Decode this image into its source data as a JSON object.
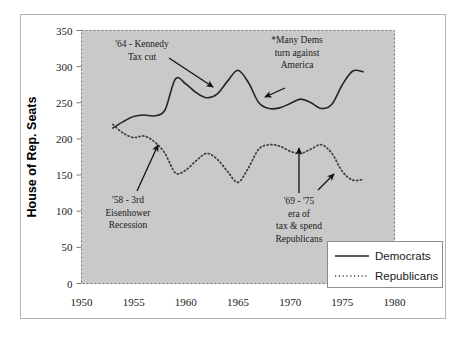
{
  "chart_data": {
    "type": "line",
    "title": "",
    "xlabel": "",
    "ylabel": "House of Rep. Seats",
    "xlim": [
      1950,
      1980
    ],
    "ylim": [
      0,
      350
    ],
    "xticks": [
      1950,
      1955,
      1960,
      1965,
      1970,
      1975,
      1980
    ],
    "yticks": [
      0,
      50,
      100,
      150,
      200,
      250,
      300,
      350
    ],
    "grid": false,
    "legend_position": "bottom-right",
    "plot_background": "#c9c9c9",
    "series": [
      {
        "name": "Democrats",
        "style": "solid",
        "color": "#262626",
        "x": [
          1953,
          1954,
          1955,
          1956,
          1957,
          1958,
          1959,
          1960,
          1961,
          1962,
          1963,
          1964,
          1965,
          1966,
          1967,
          1968,
          1969,
          1970,
          1971,
          1972,
          1973,
          1974,
          1975,
          1976,
          1977
        ],
        "values": [
          215,
          224,
          231,
          233,
          232,
          240,
          283,
          276,
          264,
          257,
          262,
          280,
          295,
          278,
          250,
          242,
          243,
          249,
          255,
          250,
          242,
          248,
          275,
          294,
          293
        ]
      },
      {
        "name": "Republicans",
        "style": "dotted",
        "color": "#3d3d3d",
        "x": [
          1953,
          1954,
          1955,
          1956,
          1957,
          1958,
          1959,
          1960,
          1961,
          1962,
          1963,
          1964,
          1965,
          1966,
          1967,
          1968,
          1969,
          1970,
          1971,
          1972,
          1973,
          1974,
          1975,
          1976,
          1977
        ],
        "values": [
          220,
          208,
          202,
          204,
          196,
          180,
          153,
          157,
          170,
          180,
          172,
          155,
          140,
          160,
          186,
          192,
          190,
          183,
          180,
          186,
          192,
          180,
          155,
          143,
          144
        ]
      }
    ],
    "annotations": [
      {
        "id": "kennedy-tax-cut",
        "lines": [
          "'64 - Kennedy",
          "Tax cut"
        ],
        "text_x": 142,
        "text_y": 47,
        "arrow": {
          "x1": 169,
          "y1": 58,
          "x2": 213,
          "y2": 87
        }
      },
      {
        "id": "many-dems",
        "lines": [
          "*Many Dems",
          "turn against",
          "America"
        ],
        "text_x": 297,
        "text_y": 43,
        "arrow": {
          "x1": 285,
          "y1": 88,
          "x2": 265,
          "y2": 97
        }
      },
      {
        "id": "eisenhower-recession",
        "lines": [
          "'58 - 3rd",
          "Eisenhower",
          "Recession"
        ],
        "text_x": 128,
        "text_y": 203,
        "arrow": {
          "x1": 137,
          "y1": 191,
          "x2": 158,
          "y2": 145
        }
      },
      {
        "id": "tax-and-spend",
        "lines": [
          "'69 - '75",
          "era of",
          "tax & spend",
          "Republicans"
        ],
        "text_x": 299,
        "text_y": 204,
        "arrow": {
          "x1": 299,
          "y1": 193,
          "x2": 299,
          "y2": 148
        }
      },
      {
        "id": "republican-dip",
        "lines": [],
        "text_x": 0,
        "text_y": 0,
        "arrow": {
          "x1": 318,
          "y1": 190,
          "x2": 334,
          "y2": 174
        }
      }
    ]
  },
  "legend": {
    "entries": [
      {
        "label": "Democrats",
        "style": "solid"
      },
      {
        "label": "Republicans",
        "style": "dotted"
      }
    ]
  }
}
